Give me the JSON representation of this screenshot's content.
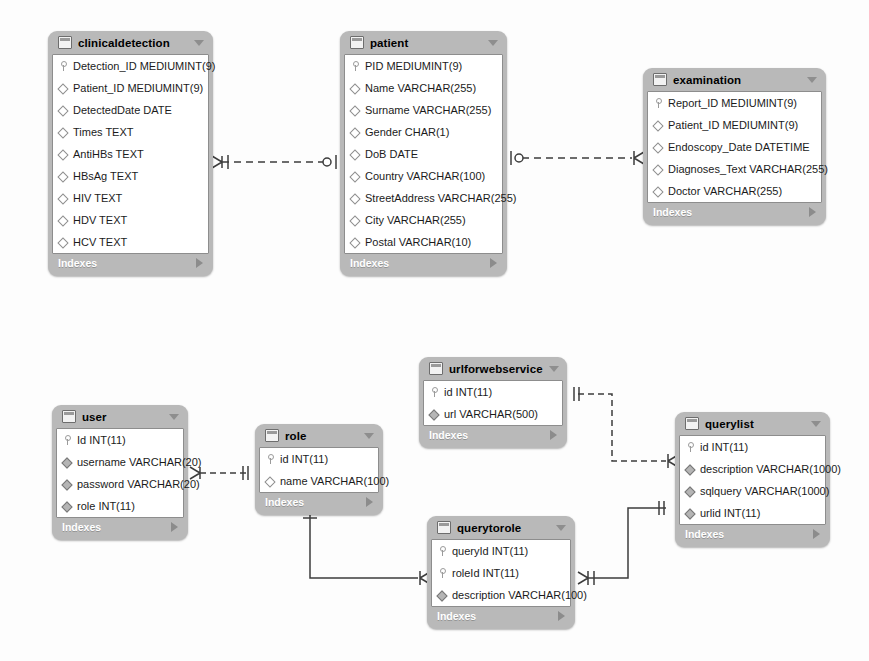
{
  "diagram": {
    "notation": "crow's-foot",
    "footer_label": "Indexes",
    "colors": {
      "table_frame": "#b9b9b9",
      "table_body": "#ffffff",
      "border": "#8d8d8d",
      "line": "#3c3c3c",
      "footer_text": "#ffffff"
    }
  },
  "tables": [
    {
      "name": "clinicaldetection",
      "x": 48,
      "y": 31,
      "width": 165,
      "footer": "Indexes",
      "columns": [
        {
          "marker": "key-icon",
          "text": "Detection_ID MEDIUMINT(9)"
        },
        {
          "marker": "diamond-open-icon",
          "text": "Patient_ID MEDIUMINT(9)"
        },
        {
          "marker": "diamond-open-icon",
          "text": "DetectedDate DATE"
        },
        {
          "marker": "diamond-open-icon",
          "text": "Times TEXT"
        },
        {
          "marker": "diamond-open-icon",
          "text": "AntiHBs TEXT"
        },
        {
          "marker": "diamond-open-icon",
          "text": "HBsAg TEXT"
        },
        {
          "marker": "diamond-open-icon",
          "text": "HIV TEXT"
        },
        {
          "marker": "diamond-open-icon",
          "text": "HDV TEXT"
        },
        {
          "marker": "diamond-open-icon",
          "text": "HCV TEXT"
        }
      ]
    },
    {
      "name": "patient",
      "x": 340,
      "y": 31,
      "width": 167,
      "footer": "Indexes",
      "columns": [
        {
          "marker": "key-icon",
          "text": "PID MEDIUMINT(9)"
        },
        {
          "marker": "diamond-open-icon",
          "text": "Name VARCHAR(255)"
        },
        {
          "marker": "diamond-open-icon",
          "text": "Surname VARCHAR(255)"
        },
        {
          "marker": "diamond-open-icon",
          "text": "Gender CHAR(1)"
        },
        {
          "marker": "diamond-open-icon",
          "text": "DoB DATE"
        },
        {
          "marker": "diamond-open-icon",
          "text": "Country VARCHAR(100)"
        },
        {
          "marker": "diamond-open-icon",
          "text": "StreetAddress VARCHAR(255)"
        },
        {
          "marker": "diamond-open-icon",
          "text": "City VARCHAR(255)"
        },
        {
          "marker": "diamond-open-icon",
          "text": "Postal VARCHAR(10)"
        }
      ]
    },
    {
      "name": "examination",
      "x": 643,
      "y": 68,
      "width": 183,
      "footer": "Indexes",
      "columns": [
        {
          "marker": "key-icon",
          "text": "Report_ID MEDIUMINT(9)"
        },
        {
          "marker": "diamond-open-icon",
          "text": "Patient_ID MEDIUMINT(9)"
        },
        {
          "marker": "diamond-open-icon",
          "text": "Endoscopy_Date DATETIME"
        },
        {
          "marker": "diamond-open-icon",
          "text": "Diagnoses_Text VARCHAR(255)"
        },
        {
          "marker": "diamond-open-icon",
          "text": "Doctor VARCHAR(255)"
        }
      ]
    },
    {
      "name": "user",
      "x": 52,
      "y": 405,
      "width": 136,
      "footer": "Indexes",
      "columns": [
        {
          "marker": "key-icon",
          "text": "Id INT(11)"
        },
        {
          "marker": "diamond-fill-icon",
          "text": "username VARCHAR(20)"
        },
        {
          "marker": "diamond-fill-icon",
          "text": "password VARCHAR(20)"
        },
        {
          "marker": "diamond-fill-icon",
          "text": "role INT(11)"
        }
      ]
    },
    {
      "name": "role",
      "x": 255,
      "y": 424,
      "width": 128,
      "footer": "Indexes",
      "columns": [
        {
          "marker": "key-icon",
          "text": "id INT(11)"
        },
        {
          "marker": "diamond-open-icon",
          "text": "name VARCHAR(100)"
        }
      ]
    },
    {
      "name": "urlforwebservice",
      "x": 419,
      "y": 357,
      "width": 148,
      "footer": "Indexes",
      "columns": [
        {
          "marker": "key-icon",
          "text": "id INT(11)"
        },
        {
          "marker": "diamond-fill-icon",
          "text": "url VARCHAR(500)"
        }
      ]
    },
    {
      "name": "querylist",
      "x": 675,
      "y": 412,
      "width": 155,
      "footer": "Indexes",
      "columns": [
        {
          "marker": "key-icon",
          "text": "id INT(11)"
        },
        {
          "marker": "diamond-fill-icon",
          "text": "description VARCHAR(1000)"
        },
        {
          "marker": "diamond-fill-icon",
          "text": "sqlquery VARCHAR(1000)"
        },
        {
          "marker": "diamond-fill-icon",
          "text": "urlid INT(11)"
        }
      ]
    },
    {
      "name": "querytorole",
      "x": 427,
      "y": 516,
      "width": 148,
      "footer": "Indexes",
      "columns": [
        {
          "marker": "key-icon",
          "text": "queryId INT(11)"
        },
        {
          "marker": "key-icon",
          "text": "roleId INT(11)"
        },
        {
          "marker": "diamond-fill-icon",
          "text": "description VARCHAR(100)"
        }
      ]
    }
  ],
  "relationships": [
    {
      "from": "clinicaldetection",
      "to": "patient",
      "style": "dashed",
      "from_end": "many",
      "to_end": "zero-or-one"
    },
    {
      "from": "patient",
      "to": "examination",
      "style": "dashed",
      "from_end": "zero-or-one",
      "to_end": "many"
    },
    {
      "from": "user",
      "to": "role",
      "style": "dashed",
      "from_end": "many",
      "to_end": "one"
    },
    {
      "from": "urlforwebservice",
      "to": "querylist",
      "style": "dashed",
      "from_end": "one",
      "to_end": "many"
    },
    {
      "from": "role",
      "to": "querytorole",
      "style": "solid",
      "from_end": "one",
      "to_end": "many"
    },
    {
      "from": "querytorole",
      "to": "querylist",
      "style": "solid",
      "from_end": "many",
      "to_end": "one"
    }
  ]
}
